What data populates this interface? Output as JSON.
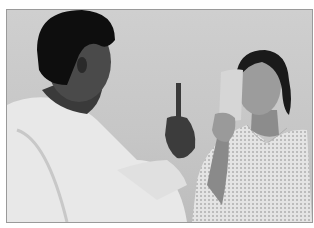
{
  "image": {
    "description": "Grayscale photo of an eye examination: a doctor in a white coat holds up a pen-like occluder/fixation target while a female patient in a patterned hospital gown covers one eye with a card.",
    "colors": {
      "background_wall": "#c8c8c8",
      "coat": "#e6e6e6",
      "hair": "#111111",
      "skin_doctor": "#5a5a5a",
      "skin_patient": "#9a9a9a",
      "gown": "#e2e2e2",
      "card": "#dcdcdc",
      "frame_border": "#9a9a9a"
    }
  }
}
